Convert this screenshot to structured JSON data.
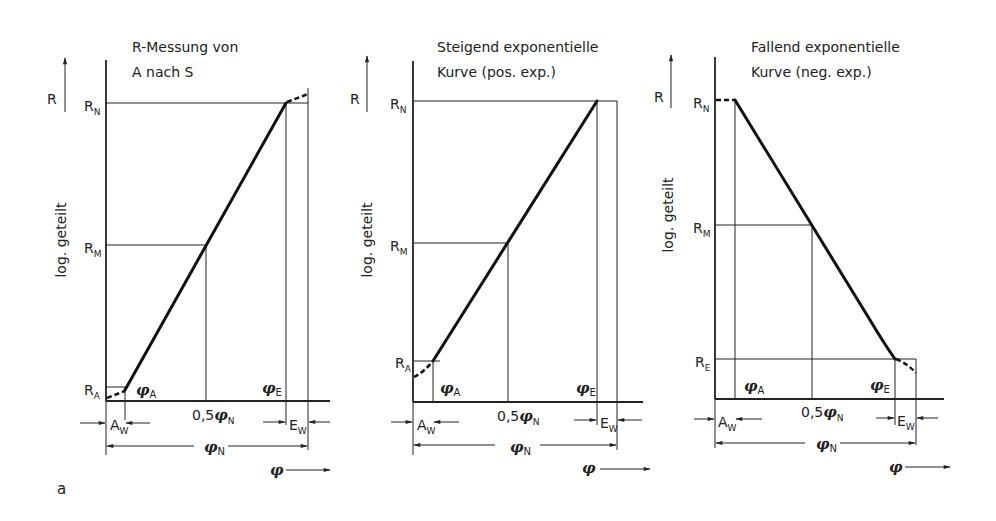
{
  "figure_label": "a",
  "shared": {
    "y_axis_symbol": "R",
    "y_axis_scale_label": "log. geteilt",
    "x_axis_symbol": "φ",
    "half_label_prefix": "0,5",
    "phi": "φ"
  },
  "panels": [
    {
      "title_line1": "R-Messung von",
      "title_line2": "A nach S",
      "y_labels": {
        "top": "R",
        "top_sub": "N",
        "mid": "R",
        "mid_sub": "M",
        "bottom": "R",
        "bottom_sub": "A"
      },
      "x_labels": {
        "start": "φ",
        "start_sub": "A",
        "half_sub": "N",
        "end": "φ",
        "end_sub": "E",
        "full_sub": "N"
      },
      "widths": {
        "a": "A",
        "a_sub": "W",
        "e": "E",
        "e_sub": "W"
      },
      "curve_type": "rising linear (log scale)"
    },
    {
      "title_line1": "Steigend exponentielle",
      "title_line2": "Kurve (pos. exp.)",
      "y_labels": {
        "top": "R",
        "top_sub": "N",
        "mid": "R",
        "mid_sub": "M",
        "bottom": "R",
        "bottom_sub": "A"
      },
      "x_labels": {
        "start": "φ",
        "start_sub": "A",
        "half_sub": "N",
        "end": "φ",
        "end_sub": "E",
        "full_sub": "N"
      },
      "widths": {
        "a": "A",
        "a_sub": "W",
        "e": "E",
        "e_sub": "W"
      },
      "curve_type": "rising exponential"
    },
    {
      "title_line1": "Fallend exponentielle",
      "title_line2": "Kurve (neg. exp.)",
      "y_labels": {
        "top": "R",
        "top_sub": "N",
        "mid": "R",
        "mid_sub": "M",
        "bottom": "R",
        "bottom_sub": "E"
      },
      "x_labels": {
        "start": "φ",
        "start_sub": "A",
        "half_sub": "N",
        "end": "φ",
        "end_sub": "E",
        "full_sub": "N"
      },
      "widths": {
        "a": "A",
        "a_sub": "W",
        "e": "E",
        "e_sub": "W"
      },
      "curve_type": "falling exponential"
    }
  ]
}
